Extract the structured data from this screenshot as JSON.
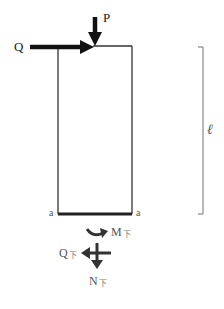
{
  "diagram": {
    "title": "",
    "labels": {
      "load_vertical": "P",
      "load_horizontal": "Q",
      "length": "ℓ",
      "section_left": "a",
      "section_right": "a",
      "moment": {
        "main": "M",
        "sub": "下"
      },
      "shear": {
        "main": "Q",
        "sub": "下"
      },
      "axial": {
        "main": "N",
        "sub": "下"
      }
    },
    "nodes": [
      {
        "id": "column",
        "type": "rectangle",
        "x": 58,
        "y": 46,
        "width": 74,
        "height": 168
      },
      {
        "id": "section-a-a",
        "type": "cut-line",
        "from": [
          58,
          214
        ],
        "to": [
          132,
          214
        ]
      },
      {
        "id": "load-P",
        "type": "arrow",
        "direction": "down",
        "at": [
          93,
          46
        ]
      },
      {
        "id": "load-Q",
        "type": "arrow",
        "direction": "right",
        "at": [
          93,
          46
        ]
      },
      {
        "id": "length-dimension",
        "type": "bracket",
        "x": 203,
        "from_y": 47,
        "to_y": 214
      },
      {
        "id": "internal-moment",
        "type": "curved-arrow",
        "at": [
          97,
          234
        ]
      },
      {
        "id": "internal-shear",
        "type": "arrow",
        "direction": "left",
        "at": [
          95,
          253
        ]
      },
      {
        "id": "internal-axial",
        "type": "arrow",
        "direction": "down",
        "at": [
          95,
          253
        ]
      }
    ],
    "colors": {
      "line": "#222222",
      "dimension": "#888888",
      "subscript": "#777777"
    }
  }
}
